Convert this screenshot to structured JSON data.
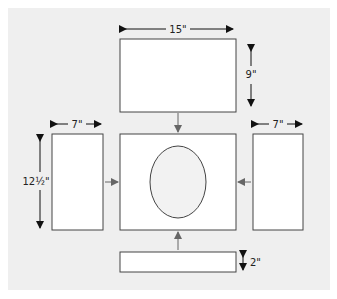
{
  "diagram": {
    "colors": {
      "background": "#efefef",
      "panel_fill": "#ffffff",
      "panel_stroke": "#333333",
      "dim_arrow": "#111111",
      "flow_arrow": "#666666"
    },
    "panels": {
      "top": {
        "width_label": "15\"",
        "height_label": "9\""
      },
      "left": {
        "width_label": "7\"",
        "height_label": "12½\""
      },
      "right": {
        "width_label": "7\""
      },
      "center": {
        "shape": "oval-opening"
      },
      "bottom": {
        "height_label": "2\""
      }
    }
  }
}
